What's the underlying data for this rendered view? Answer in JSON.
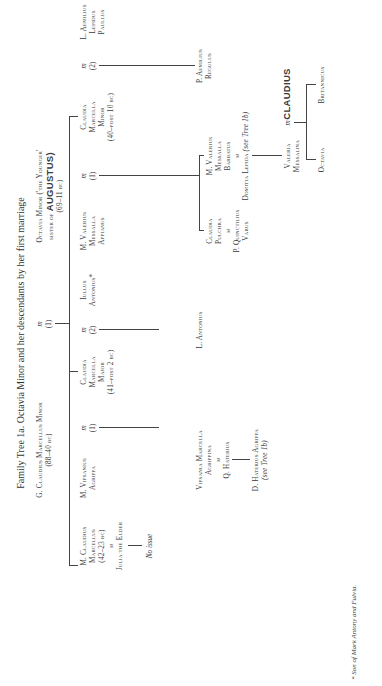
{
  "title": "Family Tree 1a. Octavia Minor and her descendants by her first marriage",
  "footnote": "* Son of Mark Antony and Fulvia.",
  "marriage_symbol": "m",
  "generation_1": {
    "husband": {
      "name": "G. Claudius Marcellus Minor",
      "dates": "(88–40 bc)"
    },
    "marriage_number": "(1)",
    "wife": {
      "name": "Octavia Minor ('the Younger'",
      "relation_prefix": "sister of",
      "relation_name": "AUGUSTUS)",
      "dates": "(69–11 bc)"
    }
  },
  "generation_2": [
    {
      "id": "marcellus",
      "lines": [
        "M. Claudius",
        "Marcellus",
        "(42–23 bc)"
      ],
      "spouse": "Julia the Elder",
      "issue": "No issue"
    },
    {
      "id": "agrippa",
      "lines": [
        "M. Vipsanius",
        "Agrippa"
      ],
      "marriage_number": "(1)"
    },
    {
      "id": "marcella-major",
      "lines": [
        "Claudia",
        "Marcella",
        "Major",
        "(41–post 2 bc)"
      ]
    },
    {
      "id": "iullus",
      "lines": [
        "Iullus",
        "Antonius*"
      ],
      "marriage_number": "(2)"
    },
    {
      "id": "appianus",
      "lines": [
        "M. Valerius",
        "Messalla",
        "Appianus"
      ],
      "marriage_number": "(1)"
    },
    {
      "id": "marcella-minor",
      "lines": [
        "Claudia",
        "Marcella",
        "Minor",
        "(40–post 10 bc)"
      ]
    },
    {
      "id": "paullus",
      "lines": [
        "L. Aemilius",
        "Lepidus",
        "Paullus"
      ],
      "marriage_number": "(2)"
    }
  ],
  "generation_3": {
    "vipsania": {
      "lines": [
        "Vipsania Marcella",
        "Agrippina"
      ],
      "spouse": "Q. Haterius"
    },
    "l_antonius": {
      "lines": [
        "L. Antonius"
      ]
    },
    "pulchra": {
      "lines": [
        "Claudia",
        "Pulchra"
      ],
      "spouse_lines": [
        "P. Quinctilius",
        "Varus"
      ]
    },
    "barbatus": {
      "lines": [
        "M. Valerius",
        "Messalla",
        "Barbatus"
      ],
      "spouse": "Domitia Lepida",
      "spouse_note": "(see Tree 1b)"
    },
    "regulus": {
      "lines": [
        "P. Aemilius",
        "Regulus"
      ]
    }
  },
  "generation_4": {
    "d_haterius": {
      "name": "D. Haterius Agrippa",
      "note": "(see Tree 1b)"
    },
    "messalina": {
      "lines": [
        "Valeria",
        "Messalina"
      ],
      "spouse": "CLAUDIUS"
    }
  },
  "generation_5": [
    {
      "name": "Octavia"
    },
    {
      "name": "Britannicus"
    }
  ]
}
